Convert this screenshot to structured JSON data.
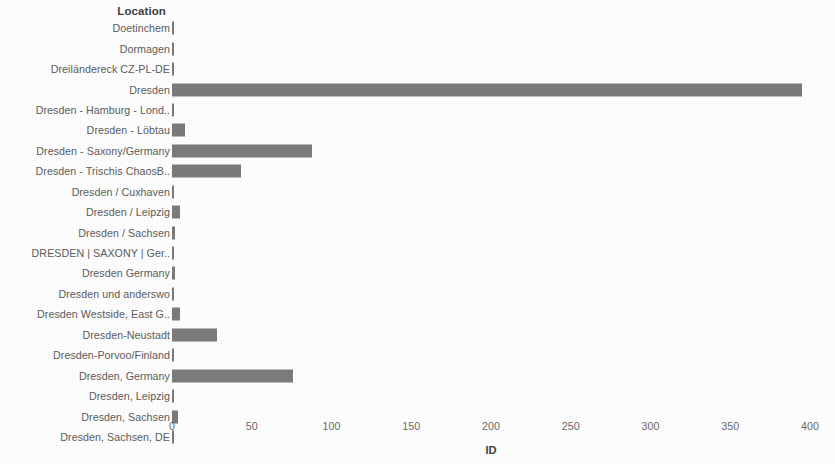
{
  "chart_data": {
    "type": "bar",
    "orientation": "horizontal",
    "title": "",
    "xlabel": "ID",
    "ylabel": "Location",
    "xlim": [
      0,
      400
    ],
    "xticks": [
      0,
      50,
      100,
      150,
      200,
      250,
      300,
      350,
      400
    ],
    "xtick_labels": [
      "0",
      "50",
      "100",
      "150",
      "200",
      "250",
      "300",
      "350",
      "400"
    ],
    "grid": false,
    "legend": "none",
    "bar_color": "#7b7b7b",
    "categories": [
      "Doetinchem",
      "Dormagen",
      "Dreiländereck CZ-PL-DE",
      "Dresden",
      "Dresden - Hamburg - Lond..",
      "Dresden - Löbtau",
      "Dresden - Saxony/Germany",
      "Dresden - Trischis ChaosB..",
      "Dresden / Cuxhaven",
      "Dresden / Leipzig",
      "Dresden /  Sachsen",
      "DRESDEN | SAXONY | Ger..",
      "Dresden Germany",
      "Dresden und anderswo",
      "Dresden Westside, East G..",
      "Dresden-Neustadt",
      "Dresden-Porvoo/Finland",
      "Dresden, Germany",
      "Dresden, Leipzig",
      "Dresden, Sachsen",
      "Dresden, Sachsen, DE"
    ],
    "values": [
      1,
      1,
      1,
      395,
      1,
      8,
      88,
      43,
      1,
      5,
      2,
      1,
      2,
      1,
      5,
      28,
      1,
      76,
      1,
      4,
      1
    ]
  }
}
